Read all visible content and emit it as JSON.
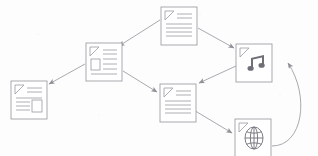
{
  "diagram": {
    "background_color": "#fdfdfd",
    "line_color": "#9a9aa2",
    "node_fill": "#ffffff",
    "nodes": [
      {
        "id": "doc-top",
        "name": "text-document-node",
        "icon": "text-document-icon",
        "label": "",
        "x": 161,
        "y": 7,
        "width": 36,
        "height": 38,
        "lines": 6
      },
      {
        "id": "doc-image-left",
        "name": "image-document-node",
        "icon": "document-with-image-icon",
        "label": "",
        "x": 86,
        "y": 43,
        "width": 36,
        "height": 38,
        "lines": 4
      },
      {
        "id": "audio-right",
        "name": "audio-file-node",
        "icon": "music-note-icon",
        "label": "",
        "x": 236,
        "y": 44,
        "width": 36,
        "height": 38,
        "lines": 0
      },
      {
        "id": "doc-far-left",
        "name": "image-document-node-left",
        "icon": "document-with-image-icon",
        "label": "",
        "x": 11,
        "y": 81,
        "width": 36,
        "height": 38,
        "lines": 4
      },
      {
        "id": "doc-center",
        "name": "text-document-node-center",
        "icon": "text-document-icon",
        "label": "",
        "x": 160,
        "y": 84,
        "width": 36,
        "height": 38,
        "lines": 6
      },
      {
        "id": "web-bottom",
        "name": "web-page-node",
        "icon": "globe-icon",
        "label": "",
        "x": 235,
        "y": 119,
        "width": 36,
        "height": 38,
        "lines": 0
      }
    ],
    "edges": [
      {
        "id": "e1",
        "name": "edge-doc-top-to-image-document",
        "from": "doc-top",
        "to": "doc-image-left",
        "shape": "straight",
        "arrowhead": "to"
      },
      {
        "id": "e2",
        "name": "edge-doc-top-to-audio",
        "from": "doc-top",
        "to": "audio-right",
        "shape": "straight",
        "arrowhead": "to"
      },
      {
        "id": "e3",
        "name": "edge-image-document-to-far-left",
        "from": "doc-image-left",
        "to": "doc-far-left",
        "shape": "straight",
        "arrowhead": "to"
      },
      {
        "id": "e4",
        "name": "edge-image-document-to-center-doc",
        "from": "doc-image-left",
        "to": "doc-center",
        "shape": "straight",
        "arrowhead": "to"
      },
      {
        "id": "e5",
        "name": "edge-audio-to-center-doc",
        "from": "audio-right",
        "to": "doc-center",
        "shape": "straight",
        "arrowhead": "to"
      },
      {
        "id": "e6",
        "name": "edge-center-doc-to-web",
        "from": "doc-center",
        "to": "web-bottom",
        "shape": "straight",
        "arrowhead": "to"
      },
      {
        "id": "e7",
        "name": "edge-web-to-audio-curved",
        "from": "web-bottom",
        "to": "audio-right",
        "shape": "curved",
        "arrowhead": "to"
      }
    ]
  }
}
